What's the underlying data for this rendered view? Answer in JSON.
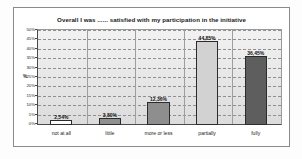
{
  "chart_data": {
    "type": "bar",
    "title": "Overall I was ...... satisfied with my participation in the initiative",
    "xlabel": "",
    "ylabel": "%",
    "categories": [
      "not at all",
      "little",
      "more or less",
      "partially",
      "fully"
    ],
    "values": [
      2.54,
      3.8,
      12.36,
      44.85,
      36.45
    ],
    "value_labels": [
      "2,54%",
      "3,80%",
      "12,36%",
      "44,85%",
      "36,45%"
    ],
    "ylim": [
      0,
      50
    ],
    "ytick_labels": [
      "0%",
      "5%",
      "10%",
      "15%",
      "20%",
      "25%",
      "30%",
      "35%",
      "40%",
      "45%",
      "50%"
    ],
    "ytick_values": [
      0,
      5,
      10,
      15,
      20,
      25,
      30,
      35,
      40,
      45,
      50
    ],
    "grid": true,
    "legend": "none",
    "bar_colors": [
      "#fcfcfc",
      "#909090",
      "#8e8e8e",
      "#d2d2d2",
      "#5e5e5e"
    ],
    "bar_border_color": "#2b2b2b",
    "plot_background": "#e8e8e8",
    "gridline_color": "#8f8f8f",
    "axis_color": "#4a4a4a",
    "frame_color": "#8a8a8a"
  }
}
